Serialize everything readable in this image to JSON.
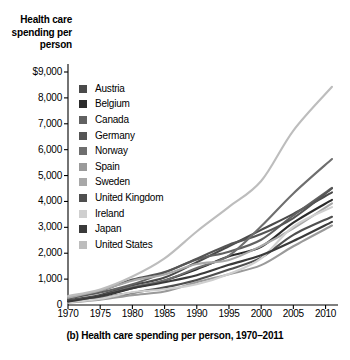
{
  "chart_data": {
    "type": "line",
    "title": "",
    "caption": "(b) Health care spending per person, 1970–2011",
    "ylabel": "Health care spending per person",
    "xlabel": "",
    "xlim": [
      1970,
      2011
    ],
    "ylim": [
      0,
      9000
    ],
    "grid": false,
    "legend_position": "inside-top-left",
    "ytick_labels": [
      "$9,000",
      "8,000",
      "7,000",
      "6,000",
      "5,000",
      "4,000",
      "3,000",
      "2,000",
      "1,000",
      "0"
    ],
    "ytick_values": [
      9000,
      8000,
      7000,
      6000,
      5000,
      4000,
      3000,
      2000,
      1000,
      0
    ],
    "xtick_labels": [
      "1970",
      "1975",
      "1980",
      "1985",
      "1990",
      "1995",
      "2000",
      "2005",
      "2010"
    ],
    "xtick_values": [
      1970,
      1975,
      1980,
      1985,
      1990,
      1995,
      2000,
      2005,
      2010
    ],
    "x": [
      1970,
      1975,
      1980,
      1985,
      1990,
      1995,
      2000,
      2005,
      2011
    ],
    "series": [
      {
        "name": "Austria",
        "color": "#4a4a4a",
        "values": [
          190,
          390,
          760,
          1060,
          1650,
          2270,
          2900,
          3520,
          4350
        ]
      },
      {
        "name": "Belgium",
        "color": "#2b2b2b",
        "values": [
          150,
          330,
          650,
          950,
          1380,
          1880,
          2250,
          3180,
          4060
        ]
      },
      {
        "name": "Canada",
        "color": "#616161",
        "values": [
          260,
          480,
          800,
          1250,
          1760,
          2060,
          2520,
          3460,
          4520
        ]
      },
      {
        "name": "Germany",
        "color": "#555555",
        "values": [
          250,
          540,
          980,
          1270,
          1790,
          2330,
          2740,
          3360,
          4500
        ]
      },
      {
        "name": "Norway",
        "color": "#6e6e6e",
        "values": [
          150,
          350,
          690,
          950,
          1430,
          1910,
          3040,
          4310,
          5640
        ]
      },
      {
        "name": "Spain",
        "color": "#9a9a9a",
        "values": [
          90,
          200,
          380,
          520,
          880,
          1190,
          1540,
          2270,
          3070
        ]
      },
      {
        "name": "Sweden",
        "color": "#a8a8a8",
        "values": [
          280,
          560,
          940,
          1180,
          1580,
          1740,
          2280,
          2960,
          3930
        ]
      },
      {
        "name": "United Kingdom",
        "color": "#4f4f4f",
        "values": [
          150,
          280,
          470,
          680,
          970,
          1370,
          1830,
          2710,
          3410
        ]
      },
      {
        "name": "Ireland",
        "color": "#cfcfcf",
        "values": [
          100,
          240,
          490,
          610,
          800,
          1200,
          1800,
          3030,
          3780
        ]
      },
      {
        "name": "Japan",
        "color": "#3a3a3a",
        "values": [
          130,
          350,
          650,
          880,
          1150,
          1550,
          1920,
          2470,
          3210
        ]
      },
      {
        "name": "United States",
        "color": "#bdbdbd",
        "values": [
          350,
          600,
          1100,
          1800,
          2840,
          3790,
          4790,
          6740,
          8430
        ]
      }
    ]
  }
}
